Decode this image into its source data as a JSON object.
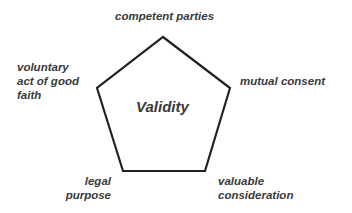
{
  "diagram": {
    "type": "pentagon",
    "center_label": "Validity",
    "vertices": [
      {
        "label": "competent parties",
        "position": "top"
      },
      {
        "label": "mutual consent",
        "position": "right"
      },
      {
        "label": "valuable consideration",
        "lines": [
          "valuable",
          "consideration"
        ],
        "position": "bottom-right"
      },
      {
        "label": "legal purpose",
        "lines": [
          "legal",
          "purpose"
        ],
        "position": "bottom-left"
      },
      {
        "label": "voluntary act of good faith",
        "lines": [
          "voluntary",
          "act of good",
          "faith"
        ],
        "position": "left"
      }
    ],
    "stroke_color": "#222222",
    "text_color": "#3a3a3a"
  }
}
